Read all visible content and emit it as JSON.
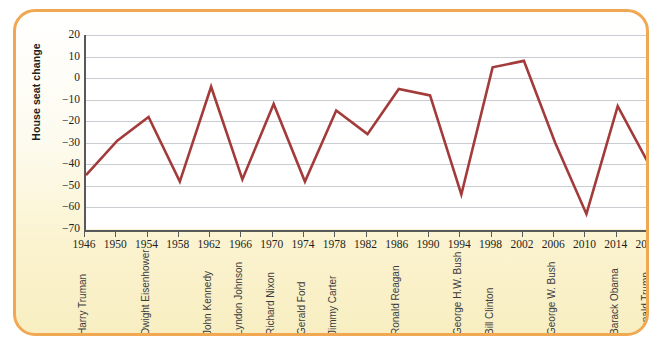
{
  "figure": {
    "border_color": "#f0a852",
    "background_top": "#ffffff",
    "background_bottom": "#f8eec2",
    "plot_background": "#ffffff"
  },
  "chart_data": {
    "type": "line",
    "title": "",
    "xlabel": "",
    "ylabel": "House seat change",
    "series_color": "#a33b3b",
    "grid": true,
    "legend": "none",
    "ylim": [
      -70,
      20
    ],
    "ytick_labels": [
      "20",
      "10",
      "0",
      "-10",
      "-20",
      "-30",
      "-40",
      "-50",
      "-60",
      "-70"
    ],
    "ytick_values": [
      20,
      10,
      0,
      -10,
      -20,
      -30,
      -40,
      -50,
      -60,
      -70
    ],
    "xlim": [
      1946,
      2018
    ],
    "xtick_labels": [
      "1946",
      "1950",
      "1954",
      "1958",
      "1962",
      "1966",
      "1970",
      "1974",
      "1978",
      "1982",
      "1986",
      "1990",
      "1994",
      "1998",
      "2002",
      "2006",
      "2010",
      "2014",
      "2018"
    ],
    "x": [
      1946,
      1950,
      1954,
      1958,
      1962,
      1966,
      1970,
      1974,
      1978,
      1982,
      1986,
      1990,
      1994,
      1998,
      2002,
      2006,
      2010,
      2014,
      2018
    ],
    "values": [
      -45,
      -29,
      -18,
      -48,
      -4,
      -47,
      -12,
      -48,
      -15,
      -26,
      -5,
      -8,
      -54,
      5,
      8,
      -30,
      -63,
      -13,
      -40
    ],
    "series": [
      {
        "name": "House seat change",
        "values": [
          -45,
          -29,
          -18,
          -48,
          -4,
          -47,
          -12,
          -48,
          -15,
          -26,
          -5,
          -8,
          -54,
          5,
          8,
          -30,
          -63,
          -13,
          -40
        ]
      }
    ],
    "annotations": [
      {
        "label": "Harry Truman",
        "x": 1946
      },
      {
        "label": "Dwight Eisenhower",
        "x": 1954
      },
      {
        "label": "John Kennedy",
        "x": 1962
      },
      {
        "label": "Lyndon Johnson",
        "x": 1966
      },
      {
        "label": "Richard Nixon",
        "x": 1970
      },
      {
        "label": "Gerald Ford",
        "x": 1974
      },
      {
        "label": "Jimmy Carter",
        "x": 1978
      },
      {
        "label": "Ronald Reagan",
        "x": 1986
      },
      {
        "label": "George H.W. Bush",
        "x": 1994
      },
      {
        "label": "Bill Clinton",
        "x": 1998
      },
      {
        "label": "George W. Bush",
        "x": 2006
      },
      {
        "label": "Barack Obama",
        "x": 2014
      },
      {
        "label": "Donald Trump",
        "x": 2018
      }
    ]
  }
}
